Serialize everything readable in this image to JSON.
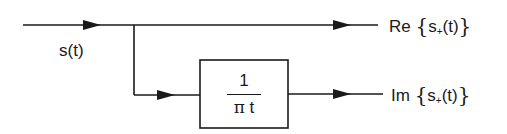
{
  "diagram": {
    "type": "block-diagram",
    "input": {
      "label": "s(t)"
    },
    "block": {
      "numerator": "1",
      "denominator_symbol": "π",
      "denominator_var": "t",
      "description": "Hilbert transform filter 1/(πt)"
    },
    "outputs": [
      {
        "prefix": "Re",
        "open": "{",
        "signal": "s",
        "subscript": "+",
        "arg": "(t)",
        "close": "}"
      },
      {
        "prefix": "Im",
        "open": "{",
        "signal": "s",
        "subscript": "+",
        "arg": "(t)",
        "close": "}"
      }
    ],
    "colors": {
      "stroke": "#1a1a1a",
      "background": "#ffffff"
    }
  }
}
